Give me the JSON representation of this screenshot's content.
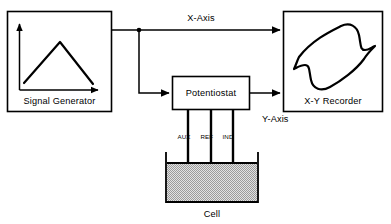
{
  "diagram": {
    "blocks": [
      {
        "id": "signal_generator",
        "label": "Signal Generator"
      },
      {
        "id": "potentiostat",
        "label": "Potentiostat"
      },
      {
        "id": "xy_recorder",
        "label": "X-Y Recorder"
      },
      {
        "id": "cell",
        "label": "Cell"
      }
    ],
    "signal_generator": {
      "label": "Signal Generator",
      "waveform": "triangular-ramp"
    },
    "potentiostat": {
      "label": "Potentiostat"
    },
    "xy_recorder": {
      "label": "X-Y Recorder",
      "waveform": "cyclic-voltammogram"
    },
    "cell": {
      "label": "Cell"
    },
    "connections": [
      {
        "id": "x_axis",
        "label": "X-Axis",
        "from": "signal_generator",
        "to": "xy_recorder"
      },
      {
        "id": "y_axis",
        "label": "Y-Axis",
        "from": "potentiostat",
        "to": "xy_recorder"
      },
      {
        "id": "sig_to_pot",
        "label": "",
        "from": "signal_generator",
        "to": "potentiostat"
      }
    ],
    "x_axis_label": "X-Axis",
    "y_axis_label": "Y-Axis",
    "electrodes": [
      {
        "id": "aux",
        "label": "AUX"
      },
      {
        "id": "ref",
        "label": "REF"
      },
      {
        "id": "ind",
        "label": "IND"
      }
    ],
    "colors": {
      "stroke": "#000000",
      "background": "#ffffff",
      "cell_solution": "#c9c9c9"
    }
  }
}
